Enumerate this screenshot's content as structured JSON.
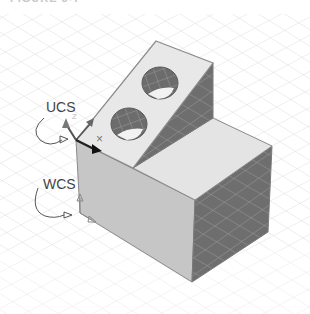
{
  "figure": {
    "title": "FIGURE 3-7",
    "labels": {
      "ucs": "UCS",
      "wcs": "WCS",
      "ucs_z_axis": "Z",
      "origin_marker": "×"
    },
    "colors": {
      "background": "#ffffff",
      "grid": "#d9d9d9",
      "light_face": "#e6e6e6",
      "front_face": "#c4c4c4",
      "dark_face": "#6e6e6e",
      "hole": "#707070",
      "edge": "#8a8a8a"
    }
  }
}
